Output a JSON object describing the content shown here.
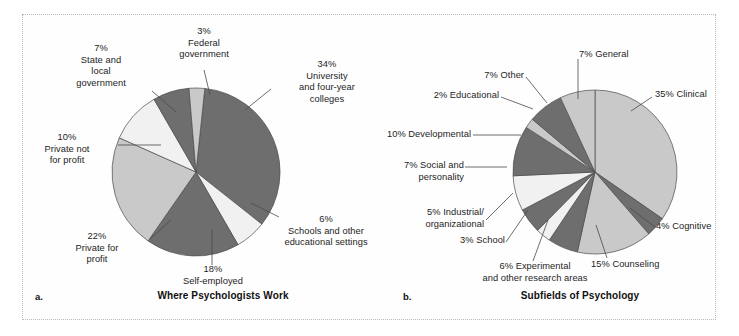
{
  "figure": {
    "background": "#fefefe",
    "border_color": "#b9b9b9"
  },
  "palette": {
    "dark_gray": "#6e6e6e",
    "mid_gray": "#9a9a9a",
    "light_gray": "#c9c9c9",
    "pale_gray": "#f1f1f1",
    "outline": "#4a4a4a",
    "leader_line": "#4a4a4a",
    "text": "#1d1d1d"
  },
  "panels": [
    {
      "letter": "a.",
      "caption": "Where Psychologists Work"
    },
    {
      "letter": "b.",
      "caption": "Subfields of Psychology"
    }
  ],
  "chart_data": [
    {
      "type": "pie",
      "title": "Where Psychologists Work",
      "panel": "a",
      "total": 100,
      "units": "percent",
      "categories": [
        "University and four-year colleges",
        "Schools and other educational settings",
        "Self-employed",
        "Private for profit",
        "Private not for profit",
        "State and local government",
        "Federal government"
      ],
      "values": [
        34,
        6,
        18,
        22,
        10,
        7,
        3
      ],
      "colors": [
        "#6e6e6e",
        "#f1f1f1",
        "#6e6e6e",
        "#c9c9c9",
        "#f1f1f1",
        "#6e6e6e",
        "#c9c9c9"
      ],
      "labels": [
        {
          "pct": "34%",
          "lines": [
            "34%",
            "University",
            "and four-year",
            "colleges"
          ]
        },
        {
          "pct": "6%",
          "lines": [
            "6%",
            "Schools and other",
            "educational settings"
          ]
        },
        {
          "pct": "18%",
          "lines": [
            "18%",
            "Self-employed"
          ]
        },
        {
          "pct": "22%",
          "lines": [
            "22%",
            "Private for",
            "profit"
          ]
        },
        {
          "pct": "10%",
          "lines": [
            "10%",
            "Private not",
            "for profit"
          ]
        },
        {
          "pct": "7%",
          "lines": [
            "7%",
            "State and",
            "local",
            "government"
          ]
        },
        {
          "pct": "3%",
          "lines": [
            "3%",
            "Federal",
            "government"
          ]
        }
      ],
      "legend": "none",
      "grid": false
    },
    {
      "type": "pie",
      "title": "Subfields of Psychology",
      "panel": "b",
      "total": 100,
      "units": "percent",
      "categories": [
        "Clinical",
        "Cognitive",
        "Counseling",
        "Experimental and other research areas",
        "School",
        "Industrial/organizational",
        "Social and personality",
        "Developmental",
        "Educational",
        "Other",
        "General"
      ],
      "values": [
        35,
        4,
        15,
        6,
        3,
        5,
        7,
        10,
        2,
        7,
        7
      ],
      "colors": [
        "#c9c9c9",
        "#6e6e6e",
        "#c9c9c9",
        "#6e6e6e",
        "#f1f1f1",
        "#6e6e6e",
        "#f1f1f1",
        "#6e6e6e",
        "#c9c9c9",
        "#6e6e6e",
        "#c9c9c9"
      ],
      "labels": [
        {
          "pct": "35%",
          "lines": [
            "35% Clinical"
          ]
        },
        {
          "pct": "4%",
          "lines": [
            "4% Cognitive"
          ]
        },
        {
          "pct": "15%",
          "lines": [
            "15% Counseling"
          ]
        },
        {
          "pct": "6%",
          "lines": [
            "6% Experimental",
            "and other research areas"
          ]
        },
        {
          "pct": "3%",
          "lines": [
            "3% School"
          ]
        },
        {
          "pct": "5%",
          "lines": [
            "5% Industrial/",
            "organizational"
          ]
        },
        {
          "pct": "7%",
          "lines": [
            "7% Social and",
            "personality"
          ]
        },
        {
          "pct": "10%",
          "lines": [
            "10% Developmental"
          ]
        },
        {
          "pct": "2%",
          "lines": [
            "2% Educational"
          ]
        },
        {
          "pct": "7%",
          "lines": [
            "7% Other"
          ]
        },
        {
          "pct": "7%",
          "lines": [
            "7% General"
          ]
        }
      ],
      "legend": "none",
      "grid": false
    }
  ],
  "labels_a": {
    "university": "34%\nUniversity\nand four-year\ncolleges",
    "schools": "6%\nSchools and other\neducational settings",
    "self": "18%\nSelf-employed",
    "privatefor": "22%\nPrivate for\nprofit",
    "privatenot": "10%\nPrivate not\nfor profit",
    "stateLocal": "7%\nState and\nlocal\ngovernment",
    "federal": "3%\nFederal\ngovernment"
  },
  "labels_b": {
    "general": "7% General",
    "clinical": "35% Clinical",
    "cognitive": "4% Cognitive",
    "counseling": "15% Counseling",
    "experimental": "6% Experimental\nand other research areas",
    "school": "3% School",
    "industrial": "5% Industrial/\norganizational",
    "social": "7% Social and\npersonality",
    "developmental": "10% Developmental",
    "educational": "2% Educational",
    "other": "7% Other"
  }
}
